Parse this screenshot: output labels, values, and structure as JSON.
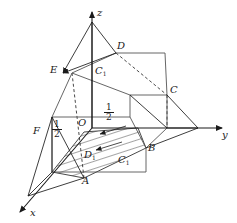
{
  "figure": {
    "width": 237,
    "height": 223,
    "background_color": "#ffffff",
    "stroke_color": "#1a1a1a",
    "hatch_color": "#1a1a1a"
  },
  "axes": {
    "x_label": "x",
    "y_label": "y",
    "z_label": "z",
    "origin_label": "O"
  },
  "vertex_labels": {
    "A": "A",
    "B": "B",
    "C": "C",
    "D": "D",
    "E": "E",
    "F": "F",
    "C_sub": "C",
    "C_sub_index": "1",
    "D1": "D",
    "D1_index": "1",
    "C1": "C",
    "C1_index": "1"
  },
  "measurements": {
    "half_left_num": "1",
    "half_left_den": "2",
    "half_center_num": "1",
    "half_center_den": "2"
  }
}
